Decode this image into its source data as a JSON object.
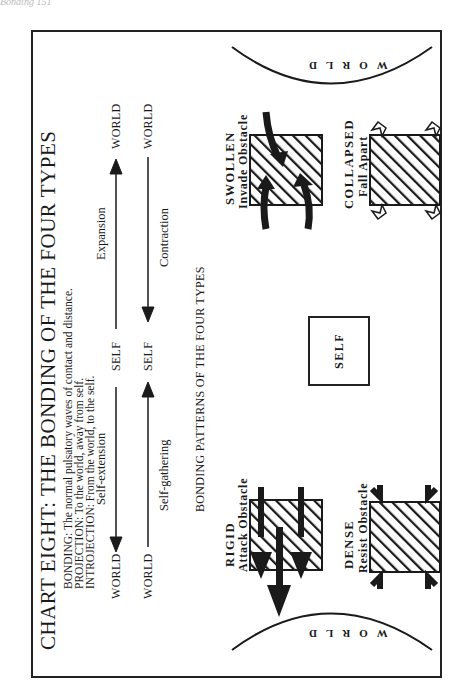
{
  "page_header": "Bonding 151",
  "chart": {
    "title": "CHART EIGHT:   THE BONDING OF THE FOUR TYPES",
    "definitions": [
      "BONDING: The normal pulsatory waves of contact and distance.",
      "PROJECTION: To the world, away from self.",
      "INTROJECTION: From the world, to the self."
    ]
  },
  "flow": {
    "top_row": {
      "left_node": "WORLD",
      "left_arrow_label": "Self-extension",
      "center_node": "SELF",
      "right_arrow_label": "Expansion",
      "right_node": "WORLD"
    },
    "bottom_row": {
      "left_node": "WORLD",
      "left_arrow_label": "Self-gathering",
      "center_node": "SELF",
      "right_arrow_label": "Contraction",
      "right_node": "WORLD"
    }
  },
  "patterns": {
    "section_title": "BONDING PATTERNS OF THE FOUR TYPES",
    "center_label": "SELF",
    "world_left": "WORLD",
    "world_right": "WORLD",
    "types": [
      {
        "name": "RIGID",
        "behavior": "Attack  Obstacle",
        "arrows": "three heavy arrows pushing out through obstacle toward world"
      },
      {
        "name": "DENSE",
        "behavior": "Resist  Obstacle",
        "arrows": "bent arrows pushing back from both sides"
      },
      {
        "name": "SWOLLEN",
        "behavior": "Invade  Obstacle",
        "arrows": "curved arrows entering obstacle from both sides"
      },
      {
        "name": "COLLAPSED",
        "behavior": "Fall  Apart",
        "arrows": "small open arrowheads pointing in at corners"
      }
    ]
  },
  "colors": {
    "ink": "#1a1a1a",
    "paper": "#ffffff"
  }
}
